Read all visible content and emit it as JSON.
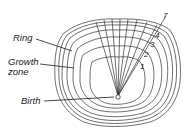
{
  "diagram": {
    "labels": {
      "ring": "Ring",
      "growth_zone_line1": "Growth",
      "growth_zone_line2": "zone",
      "birth": "Birth"
    },
    "ring_numbers": [
      "1",
      "2",
      "3",
      "4",
      "7"
    ],
    "colors": {
      "stroke": "#333333",
      "background": "#ffffff"
    }
  }
}
